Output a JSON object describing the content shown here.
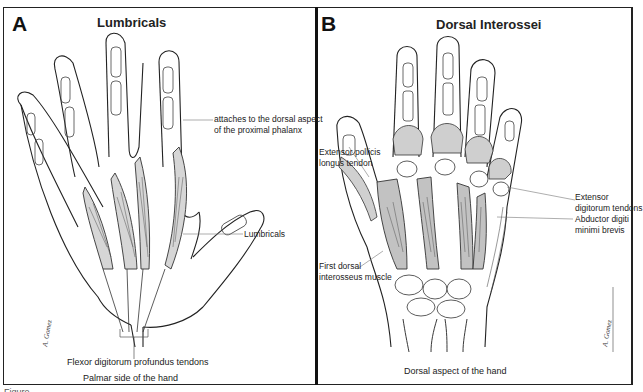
{
  "panels": [
    {
      "letter": "A",
      "title": "Lumbricals",
      "labels": {
        "attach_line1": "attaches to the dorsal aspect",
        "attach_line2": "of the proximal phalanx",
        "lumbricals": "Lumbricals",
        "fdp_tendons": "Flexor digitorum profundus tendons",
        "view": "Palmar side of the hand"
      },
      "signature": "A. Gomez"
    },
    {
      "letter": "B",
      "title": "Dorsal Interossei",
      "labels": {
        "epl_line1": "Extensor pollicis",
        "epl_line2": "longus tendon",
        "edt_line1": "Extensor",
        "edt_line2": "digitorum tendons",
        "first_di_line1": "First dorsal",
        "first_di_line2": "interosseus muscle",
        "adm_line1": "Abductor digiti",
        "adm_line2": "minimi brevis",
        "view": "Dorsal aspect of the hand"
      },
      "signature": "A. Gomez"
    }
  ],
  "figure_caption": "Figure"
}
